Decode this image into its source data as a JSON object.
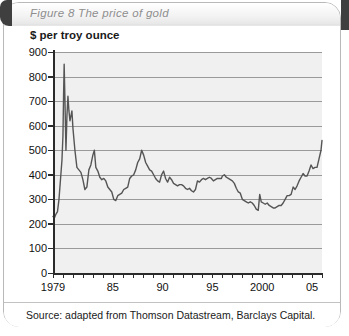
{
  "figure": {
    "title": "Figure 8  The price of gold",
    "source": "Source: adapted from Thomson Datastream, Barclays Capital."
  },
  "chart_data": {
    "type": "line",
    "title": "Figure 8  The price of gold",
    "ylabel": "$ per troy ounce",
    "xlabel": "",
    "ylim": [
      0,
      900
    ],
    "xlim": [
      1979,
      2006
    ],
    "ytick_values": [
      0,
      100,
      200,
      300,
      400,
      500,
      600,
      700,
      800,
      900
    ],
    "ytick_labels": [
      "0",
      "100",
      "200",
      "300",
      "400",
      "500",
      "600",
      "700",
      "800",
      "900"
    ],
    "xtick_values": [
      1979,
      1985,
      1990,
      1995,
      2000,
      2005
    ],
    "xtick_labels": [
      "1979",
      "85",
      "90",
      "95",
      "2000",
      "05"
    ],
    "xtick_minor_step": 1,
    "grid": "horizontal",
    "legend": "none",
    "line_color": "#555555",
    "plot_background": "#f0f0f0",
    "series": [
      {
        "name": "Gold price",
        "unit": "$ per troy ounce",
        "x": [
          1979.0,
          1979.15,
          1979.3,
          1979.45,
          1979.6,
          1979.75,
          1979.9,
          1980.0,
          1980.06,
          1980.12,
          1980.2,
          1980.3,
          1980.4,
          1980.5,
          1980.6,
          1980.7,
          1980.8,
          1980.9,
          1981.0,
          1981.2,
          1981.4,
          1981.6,
          1981.8,
          1982.0,
          1982.2,
          1982.4,
          1982.6,
          1982.8,
          1983.0,
          1983.15,
          1983.3,
          1983.5,
          1983.7,
          1983.9,
          1984.1,
          1984.3,
          1984.5,
          1984.7,
          1984.9,
          1985.1,
          1985.3,
          1985.5,
          1985.7,
          1985.9,
          1986.1,
          1986.3,
          1986.5,
          1986.7,
          1986.9,
          1987.1,
          1987.3,
          1987.5,
          1987.7,
          1987.9,
          1988.1,
          1988.3,
          1988.5,
          1988.7,
          1988.9,
          1989.1,
          1989.3,
          1989.5,
          1989.7,
          1989.9,
          1990.1,
          1990.3,
          1990.5,
          1990.7,
          1990.9,
          1991.1,
          1991.3,
          1991.5,
          1991.7,
          1991.9,
          1992.1,
          1992.3,
          1992.5,
          1992.7,
          1992.9,
          1993.1,
          1993.3,
          1993.5,
          1993.7,
          1993.9,
          1994.1,
          1994.3,
          1994.5,
          1994.7,
          1994.9,
          1995.1,
          1995.3,
          1995.5,
          1995.7,
          1995.9,
          1996.0,
          1996.2,
          1996.4,
          1996.6,
          1996.8,
          1997.0,
          1997.2,
          1997.4,
          1997.6,
          1997.8,
          1998.0,
          1998.2,
          1998.4,
          1998.6,
          1998.8,
          1999.0,
          1999.2,
          1999.4,
          1999.6,
          1999.75,
          1999.9,
          2000.1,
          2000.3,
          2000.5,
          2000.7,
          2000.9,
          2001.1,
          2001.3,
          2001.5,
          2001.7,
          2001.9,
          2002.1,
          2002.3,
          2002.5,
          2002.7,
          2002.9,
          2003.1,
          2003.3,
          2003.5,
          2003.7,
          2003.9,
          2004.1,
          2004.3,
          2004.5,
          2004.7,
          2004.9,
          2005.1,
          2005.3,
          2005.5,
          2005.7,
          2005.9,
          2006.0
        ],
        "values": [
          230,
          225,
          240,
          250,
          300,
          380,
          460,
          560,
          720,
          850,
          700,
          500,
          640,
          720,
          660,
          620,
          640,
          660,
          590,
          500,
          430,
          420,
          410,
          380,
          340,
          350,
          420,
          440,
          480,
          500,
          430,
          415,
          390,
          380,
          385,
          375,
          350,
          340,
          330,
          300,
          295,
          315,
          320,
          325,
          340,
          345,
          350,
          385,
          395,
          400,
          420,
          450,
          465,
          500,
          480,
          450,
          435,
          420,
          415,
          400,
          385,
          375,
          370,
          400,
          415,
          385,
          370,
          390,
          380,
          365,
          360,
          355,
          360,
          360,
          355,
          345,
          340,
          345,
          335,
          330,
          340,
          375,
          370,
          380,
          385,
          380,
          385,
          390,
          385,
          375,
          380,
          385,
          385,
          385,
          395,
          400,
          390,
          385,
          380,
          375,
          365,
          345,
          330,
          325,
          300,
          295,
          290,
          285,
          290,
          285,
          275,
          260,
          255,
          320,
          290,
          285,
          280,
          285,
          275,
          270,
          265,
          265,
          270,
          275,
          275,
          285,
          300,
          315,
          315,
          320,
          350,
          340,
          355,
          375,
          390,
          405,
          395,
          395,
          415,
          440,
          425,
          430,
          430,
          465,
          500,
          540
        ]
      }
    ],
    "annotations": [
      {
        "text": "peak",
        "year": 1980,
        "value": 850
      },
      {
        "text": "trough",
        "year": 1999.6,
        "value": 255
      },
      {
        "text": "end",
        "year": 2006,
        "value": 540
      }
    ]
  }
}
